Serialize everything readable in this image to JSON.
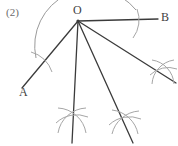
{
  "figure": {
    "index_label": "(2)",
    "caption": "",
    "points": {
      "vertex": "O",
      "ray_left": "A",
      "ray_right": "B"
    },
    "colors": {
      "ray_stroke": "#3b3b3b",
      "arc_stroke": "#9a9a9a",
      "mark_stroke": "#a6a6a6",
      "label_text": "#3f3f3f",
      "index_text": "#6b6b6b",
      "background": "#ffffff"
    },
    "geometry": {
      "vertex_xy": [
        78,
        21
      ],
      "arc_radius": 57,
      "ray_endpoints": {
        "OA": [
          22,
          88
        ],
        "OB": [
          158,
          19
        ],
        "ray1_middle": [
          73,
          143
        ],
        "ray2": [
          133,
          143
        ],
        "ray3": [
          175,
          82
        ]
      },
      "cross_marks": [
        [
          72,
          120
        ],
        [
          125,
          122
        ],
        [
          163,
          72
        ]
      ],
      "construction_arcs": 4
    }
  }
}
